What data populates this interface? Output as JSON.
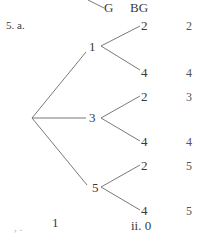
{
  "header": {
    "col_g": "G",
    "col_bg": "BG"
  },
  "problem": {
    "label": "5. a."
  },
  "tree": {
    "root": "",
    "branches": [
      {
        "label": "1",
        "leaves": [
          {
            "label": "2",
            "result": "2"
          },
          {
            "label": "4",
            "result": "4"
          }
        ]
      },
      {
        "label": "3",
        "leaves": [
          {
            "label": "2",
            "result": "3"
          },
          {
            "label": "4",
            "result": "4"
          }
        ]
      },
      {
        "label": "5",
        "leaves": [
          {
            "label": "2",
            "result": "5"
          },
          {
            "label": "4",
            "result": "5"
          }
        ]
      }
    ]
  },
  "footer": {
    "part_i_marks": ",  .",
    "part_i_value": "1",
    "part_ii": "ii. 0"
  }
}
